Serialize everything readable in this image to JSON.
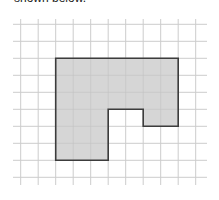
{
  "caption": {
    "text": "shown below."
  },
  "grid": {
    "columns": 10,
    "rows": 9,
    "x_lines": [
      20.7,
      38.2,
      55.7,
      73.2,
      90.7,
      108.2,
      125.7,
      143.2,
      160.7,
      178.2,
      195.7
    ],
    "y_lines": [
      24.3,
      41.3,
      58.3,
      75.3,
      92.3,
      109.3,
      126.3,
      143.3,
      160.3,
      177.3
    ],
    "line_color": "#cccccc"
  },
  "shape": {
    "description": "Rectilinear polygon shaded gray on grid paper",
    "vertices_grid": [
      [
        2,
        2
      ],
      [
        9,
        2
      ],
      [
        9,
        6
      ],
      [
        7,
        6
      ],
      [
        7,
        5
      ],
      [
        5,
        5
      ],
      [
        5,
        8
      ],
      [
        2,
        8
      ]
    ],
    "fill_color": "#d6d6d6",
    "stroke_color": "#3c3c3c"
  }
}
